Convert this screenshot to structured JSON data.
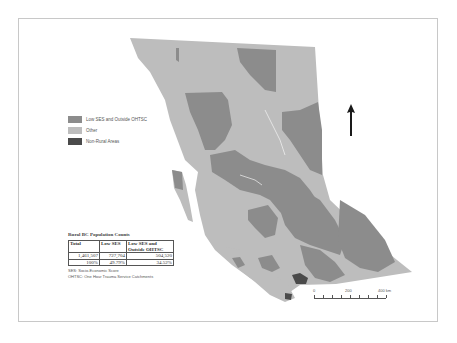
{
  "map": {
    "title": "Rural BC Population Counts Map",
    "colors": {
      "low_ses_outside_ohtsc": "#8c8c8c",
      "other": "#bdbdbd",
      "non_rural": "#4a4a4a",
      "frame": "#c8c8c8"
    }
  },
  "legend": {
    "items": [
      {
        "label": "Low SES and Outside OHTSC",
        "color": "#8c8c8c"
      },
      {
        "label": "Other",
        "color": "#bdbdbd"
      },
      {
        "label": "Non-Rural Areas",
        "color": "#4a4a4a"
      }
    ]
  },
  "table": {
    "title": "Rural BC Population Counts",
    "headers": [
      "Total",
      "Low SES",
      "Low SES and Outside OHTSC"
    ],
    "rows": [
      [
        "1,461,507",
        "727,704",
        "504,520"
      ],
      [
        "100%",
        "49.79%",
        "34.52%"
      ]
    ],
    "notes": [
      "SES: Socio-Economic Score",
      "OHTSC: One Hour Trauma Service Catchments"
    ]
  },
  "scale_bar": {
    "labels": [
      "0",
      "200",
      "400 km"
    ]
  },
  "north_arrow": {
    "icon": "north-arrow-icon"
  }
}
